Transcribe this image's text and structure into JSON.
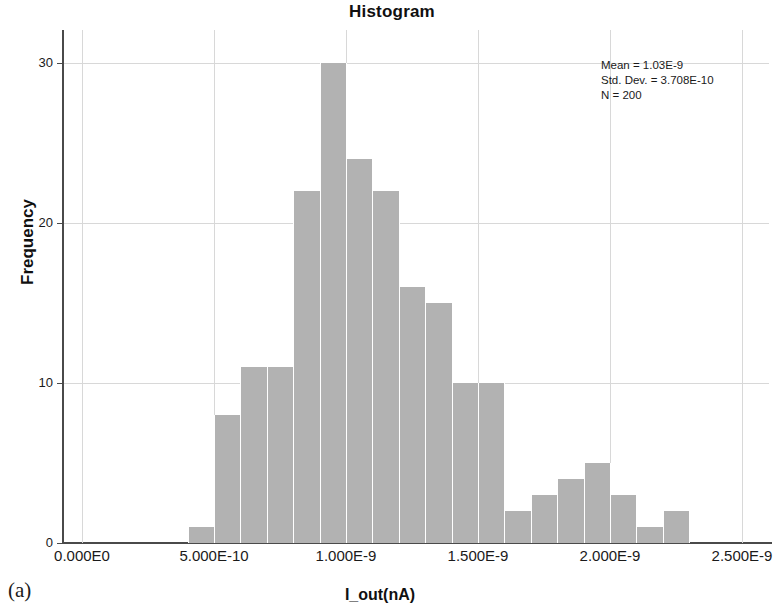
{
  "figure": {
    "subfigure_label": "(a)"
  },
  "chart_data": {
    "type": "bar",
    "title": "Histogram",
    "xlabel": "I_out(nA)",
    "ylabel": "Frequency",
    "xlim": [
      0.0,
      2.5e-09
    ],
    "ylim": [
      0,
      31
    ],
    "grid": true,
    "legend": "none",
    "bin_width": 1e-10,
    "x_tick_labels": [
      "0.000E0",
      "5.000E-10",
      "1.000E-9",
      "1.500E-9",
      "2.000E-9",
      "2.500E-9"
    ],
    "x_tick_values": [
      0.0,
      5e-10,
      1e-09,
      1.5e-09,
      2e-09,
      2.5e-09
    ],
    "y_tick_labels": [
      "0",
      "10",
      "20",
      "30"
    ],
    "y_tick_values": [
      0,
      10,
      20,
      30
    ],
    "bin_starts": [
      4e-10,
      5e-10,
      6e-10,
      7e-10,
      8e-10,
      9e-10,
      1e-09,
      1.1e-09,
      1.2e-09,
      1.3e-09,
      1.4e-09,
      1.5e-09,
      1.6e-09,
      1.7e-09,
      1.8e-09,
      1.9e-09,
      2e-09,
      2.1e-09,
      2.2e-09
    ],
    "categories": [
      "4.0E-10",
      "5.0E-10",
      "6.0E-10",
      "7.0E-10",
      "8.0E-10",
      "9.0E-10",
      "1.0E-9",
      "1.1E-9",
      "1.2E-9",
      "1.3E-9",
      "1.4E-9",
      "1.5E-9",
      "1.6E-9",
      "1.7E-9",
      "1.8E-9",
      "1.9E-9",
      "2.0E-9",
      "2.1E-9",
      "2.2E-9"
    ],
    "values": [
      1,
      8,
      11,
      11,
      22,
      30,
      24,
      22,
      16,
      15,
      10,
      10,
      2,
      3,
      4,
      5,
      3,
      1,
      2
    ],
    "bar_color": "#b2b2b2",
    "annotations": {
      "mean": "Mean = 1.03E-9",
      "std_dev": "Std. Dev. = 3.708E-10",
      "n": "N = 200"
    }
  }
}
